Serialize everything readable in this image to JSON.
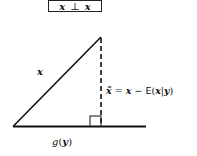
{
  "title": {
    "left": "x",
    "operator": "⊥",
    "right": "x"
  },
  "labels": {
    "hypotenuse": "x",
    "residual": {
      "lhs": "x̃",
      "eq": "=",
      "x": "x",
      "minus": "−",
      "E": "E",
      "open": "(",
      "x2": "x",
      "bar": "|",
      "y": "y",
      "close": ")"
    },
    "baseline": {
      "g": "g",
      "open": "(",
      "y": "y",
      "close": ")"
    }
  },
  "geometry": {
    "baseline": {
      "x1": 13,
      "y1": 126.5,
      "x2": 146,
      "y2": 126.5
    },
    "hypotenuse": {
      "x1": 13,
      "y1": 126.5,
      "x2": 101,
      "y2": 37
    },
    "projection": {
      "x1": 101,
      "y1": 38,
      "x2": 101,
      "y2": 126
    },
    "right_angle_box": {
      "x": 90,
      "y": 116,
      "w": 11,
      "h": 10.5
    }
  },
  "colors": {
    "stroke": "#111111",
    "background": "#ffffff"
  }
}
